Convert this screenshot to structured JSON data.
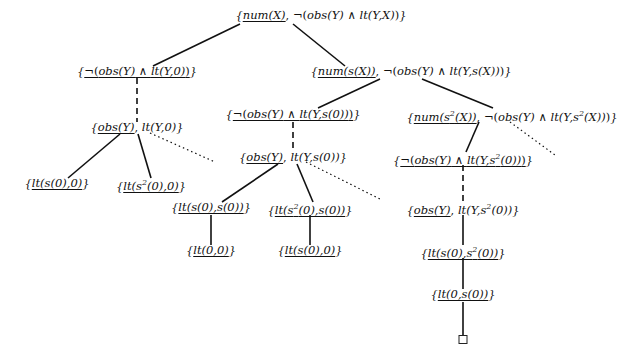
{
  "diagram": {
    "type": "SLD-tree",
    "nodes": [
      {
        "id": "root",
        "label": "{num(X), ¬(obs(Y) ∧ lt(Y,X))}",
        "selected": "num(X)",
        "x": 321,
        "y": 8
      },
      {
        "id": "n1",
        "label": "{¬(obs(Y) ∧ lt(Y,0))}",
        "selected": "¬(obs(Y) ∧ lt(Y,0))",
        "x": 137,
        "y": 64
      },
      {
        "id": "n2",
        "label": "{num(s(X)), ¬(obs(Y) ∧ lt(Y,s(X)))}",
        "selected": "num(s(X))",
        "x": 411,
        "y": 64
      },
      {
        "id": "n1a",
        "label": "{obs(Y), lt(Y,0)}",
        "selected": "obs(Y)",
        "x": 137,
        "y": 120
      },
      {
        "id": "n1a1",
        "label": "{lt(s(0),0)}",
        "selected": "lt(s(0),0)",
        "x": 57,
        "y": 176
      },
      {
        "id": "n1a2",
        "label": "{lt(s²(0),0)}",
        "selected": "lt(s²(0),0)",
        "x": 151,
        "y": 176
      },
      {
        "id": "n2a",
        "label": "{¬(obs(Y) ∧ lt(Y,s(0)))}",
        "selected": "¬(obs(Y) ∧ lt(Y,s(0)))",
        "x": 293,
        "y": 107
      },
      {
        "id": "n2b",
        "label": "{num(s²(X)), ¬(obs(Y) ∧ lt(Y,s²(X)))}",
        "selected": "num(s²(X))",
        "x": 512,
        "y": 107
      },
      {
        "id": "n2a1",
        "label": "{obs(Y), lt(Y,s(0))}",
        "selected": "obs(Y)",
        "x": 293,
        "y": 150
      },
      {
        "id": "n2a1a",
        "label": "{lt(s(0),s(0))}",
        "selected": "lt(s(0),s(0))",
        "x": 211,
        "y": 200
      },
      {
        "id": "n2a1b",
        "label": "{lt(s²(0),s(0))}",
        "selected": "lt(s²(0),s(0))",
        "x": 310,
        "y": 200
      },
      {
        "id": "n2a1a1",
        "label": "{lt(0,0)}",
        "selected": "lt(0,0)",
        "x": 211,
        "y": 243
      },
      {
        "id": "n2a1b1",
        "label": "{lt(s(0),0)}",
        "selected": "lt(s(0),0)",
        "x": 310,
        "y": 243
      },
      {
        "id": "n2b1",
        "label": "{¬(obs(Y) ∧ lt(Y,s²(0)))}",
        "selected": "¬(obs(Y) ∧ lt(Y,s²(0)))",
        "x": 463,
        "y": 150
      },
      {
        "id": "n2b1a",
        "label": "{obs(Y), lt(Y,s²(0))}",
        "selected": "obs(Y)",
        "x": 463,
        "y": 200
      },
      {
        "id": "n2b1a1",
        "label": "{lt(s(0),s²(0))}",
        "selected": "lt(s(0),s²(0))",
        "x": 463,
        "y": 243
      },
      {
        "id": "n2b1a1a",
        "label": "{lt(0,s(0))}",
        "selected": "lt(0,s(0))",
        "x": 463,
        "y": 287
      },
      {
        "id": "success",
        "label": "□",
        "x": 463,
        "y": 335
      }
    ],
    "edges": [
      {
        "from": "root",
        "to": "n1",
        "style": "solid"
      },
      {
        "from": "root",
        "to": "n2",
        "style": "solid"
      },
      {
        "from": "n1",
        "to": "n1a",
        "style": "dashed"
      },
      {
        "from": "n1a",
        "to": "n1a1",
        "style": "solid"
      },
      {
        "from": "n1a",
        "to": "n1a2",
        "style": "solid"
      },
      {
        "from": "n1a",
        "to": "more",
        "style": "dotted"
      },
      {
        "from": "n2",
        "to": "n2a",
        "style": "solid"
      },
      {
        "from": "n2",
        "to": "n2b",
        "style": "solid"
      },
      {
        "from": "n2a",
        "to": "n2a1",
        "style": "dashed"
      },
      {
        "from": "n2a1",
        "to": "n2a1a",
        "style": "solid"
      },
      {
        "from": "n2a1",
        "to": "n2a1b",
        "style": "solid"
      },
      {
        "from": "n2a1",
        "to": "more",
        "style": "dotted"
      },
      {
        "from": "n2a1a",
        "to": "n2a1a1",
        "style": "solid"
      },
      {
        "from": "n2a1b",
        "to": "n2a1b1",
        "style": "solid"
      },
      {
        "from": "n2b",
        "to": "n2b1",
        "style": "solid"
      },
      {
        "from": "n2b",
        "to": "more",
        "style": "dotted"
      },
      {
        "from": "n2b1",
        "to": "n2b1a",
        "style": "dashed"
      },
      {
        "from": "n2b1a",
        "to": "n2b1a1",
        "style": "solid"
      },
      {
        "from": "n2b1a1",
        "to": "n2b1a1a",
        "style": "solid"
      },
      {
        "from": "n2b1a1a",
        "to": "success",
        "style": "solid"
      }
    ]
  }
}
